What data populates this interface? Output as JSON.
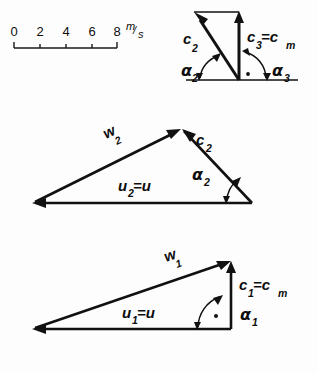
{
  "figure": {
    "type": "velocity-triangle-diagram",
    "background_color": "#fdfdfd",
    "ink_color": "#111111"
  },
  "scale_bar": {
    "name": "velocity-scale",
    "ticks": [
      "0",
      "2",
      "4",
      "6",
      "8"
    ],
    "unit": "m/s",
    "unit_numerator": "m",
    "unit_denominator": "s",
    "unit_slash": "/"
  },
  "diagrams": [
    {
      "id": "exit-outlet-triangle",
      "labels": {
        "c2": "c",
        "c2_sub": "2",
        "c3": "c",
        "c3_sub": "3",
        "c3_eq": "=c",
        "c3_eq_sub": "m",
        "alpha2": "α",
        "alpha2_sub": "2",
        "alpha3": "α",
        "alpha3_sub": "3"
      }
    },
    {
      "id": "rotor-exit-triangle",
      "labels": {
        "w2": "w",
        "w2_sub": "2",
        "c2": "c",
        "c2_sub": "2",
        "u2": "u",
        "u2_sub": "2",
        "u2_eq": "=u",
        "alpha2": "α",
        "alpha2_sub": "2"
      }
    },
    {
      "id": "rotor-inlet-triangle",
      "labels": {
        "w1": "w",
        "w1_sub": "1",
        "c1": "c",
        "c1_sub": "1",
        "c1_eq": "=c",
        "c1_eq_sub": "m",
        "u1": "u",
        "u1_sub": "1",
        "u1_eq": "=u",
        "alpha1": "α",
        "alpha1_sub": "1"
      }
    }
  ]
}
